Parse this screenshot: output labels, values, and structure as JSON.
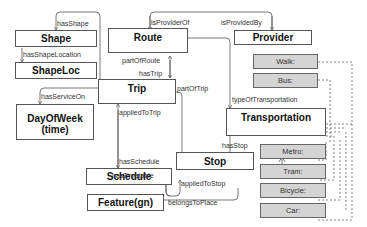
{
  "diagram": {
    "classes": {
      "shape": "Shape",
      "shapeloc": "ShapeLoc",
      "route": "Route",
      "provider": "Provider",
      "trip": "Trip",
      "dayofweek_line1": "DayOfWeek",
      "dayofweek_line2": "(time)",
      "schedule": "Schedule",
      "stop": "Stop",
      "feature": "Feature(gn)",
      "transportation": "Transportation"
    },
    "subtypes": [
      "Walk:",
      "Bus:",
      "Metro:",
      "Tram:",
      "Bicycle:",
      "Car:"
    ],
    "relations": {
      "hasShape": "hasShape",
      "hasShapeLocation": "hasShapeLocation",
      "isProviderOf": "isProviderOf",
      "isProvidedBy": "isProvidedBy",
      "partOfRoute": "partOfRoute",
      "hasTrip": "hasTrip",
      "partOfTrip": "partOfTrip",
      "hasServiceOn": "hasServiceOn",
      "typeOfTransportation": "typeOfTransportation",
      "appliedToTrip": "appliedToTrip",
      "hasSchedule": "hasSchedule",
      "hasStop": "hasStop",
      "hasTimetable": "hasTimetable",
      "appliedToStop": "appliedToStop",
      "belongsToPlace": "belongsToPlace"
    },
    "colors": {
      "box_border": "#555555",
      "subtype_fill": "#d4d4d4",
      "line": "#555555"
    }
  }
}
